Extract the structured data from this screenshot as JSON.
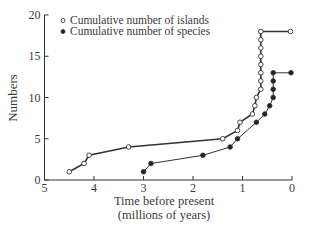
{
  "chart_data": {
    "type": "line",
    "title": "",
    "xlabel": "Time before present\n(millions of years)",
    "xlabel_lines": [
      "Time before present",
      "(millions of years)"
    ],
    "ylabel": "Numbers",
    "xlim": [
      5,
      0
    ],
    "ylim": [
      0,
      20
    ],
    "x_reversed": true,
    "x_ticks": [
      5,
      4,
      3,
      2,
      1,
      0
    ],
    "y_ticks": [
      0,
      5,
      10,
      15,
      20
    ],
    "grid": false,
    "legend_position": "top-left",
    "series": [
      {
        "name": "Cumulative number of islands",
        "marker": "open-circle",
        "x": [
          4.5,
          4.2,
          4.1,
          3.3,
          1.4,
          1.1,
          1.05,
          0.8,
          0.75,
          0.72,
          0.63,
          0.63,
          0.63,
          0.63,
          0.63,
          0.63,
          0.63,
          0.63,
          0.03
        ],
        "y": [
          1,
          2,
          3,
          4,
          5,
          6,
          7,
          8,
          9,
          10,
          11,
          12,
          13,
          14,
          15,
          16,
          17,
          18,
          18
        ]
      },
      {
        "name": "Cumulative number of species",
        "marker": "filled-circle",
        "x": [
          3.0,
          2.85,
          1.8,
          1.25,
          1.1,
          0.72,
          0.55,
          0.45,
          0.38,
          0.38,
          0.38,
          0.38,
          0.02
        ],
        "y": [
          1,
          2,
          3,
          4,
          5,
          7,
          8,
          9,
          10,
          11,
          12,
          13,
          13
        ]
      }
    ]
  }
}
